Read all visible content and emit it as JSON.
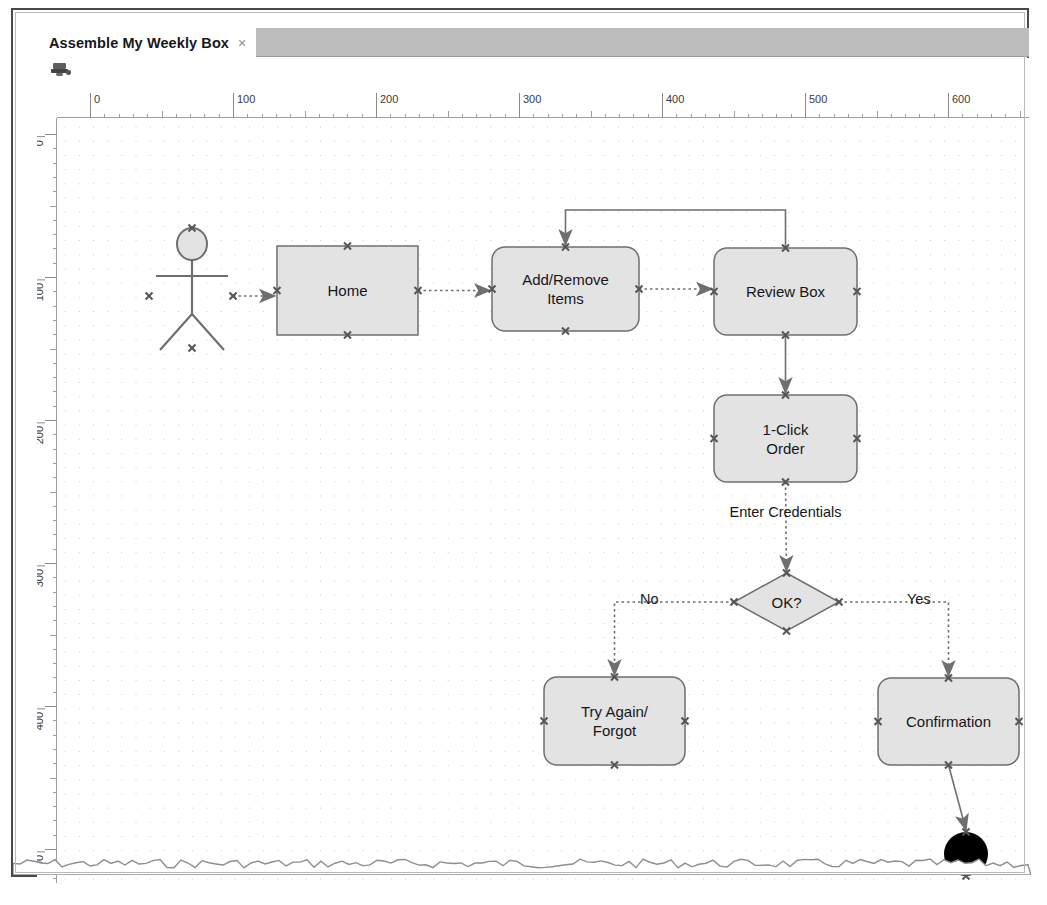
{
  "window": {
    "tab_title": "Assemble My Weekly Box",
    "tab_close_glyph": "×",
    "toolbar_icon": "stamp-icon"
  },
  "rulers": {
    "horizontal_labels": [
      "0",
      "100",
      "200",
      "300",
      "400",
      "500",
      "600"
    ],
    "vertical_labels": [
      "0",
      "100",
      "200",
      "300",
      "400",
      "500"
    ],
    "unit_step": 100,
    "minor_step": 10
  },
  "diagram": {
    "type": "activity-flowchart",
    "grid": "dotted",
    "nodes": [
      {
        "id": "actor",
        "kind": "actor",
        "label": "",
        "x": 104,
        "y": 110,
        "w": 62,
        "h": 120
      },
      {
        "id": "home",
        "kind": "rect",
        "label": "Home",
        "x": 220,
        "y": 128,
        "w": 141,
        "h": 89
      },
      {
        "id": "add_remove",
        "kind": "round-rect",
        "label": "Add/Remove\nItems",
        "x": 435,
        "y": 129,
        "w": 147,
        "h": 84
      },
      {
        "id": "review_box",
        "kind": "round-rect",
        "label": "Review Box",
        "x": 657,
        "y": 130,
        "w": 143,
        "h": 87
      },
      {
        "id": "one_click",
        "kind": "round-rect",
        "label": "1-Click\nOrder",
        "x": 657,
        "y": 277,
        "w": 143,
        "h": 87
      },
      {
        "id": "ok_decision",
        "kind": "diamond",
        "label": "OK?",
        "x": 677,
        "y": 455,
        "w": 105,
        "h": 58
      },
      {
        "id": "try_again",
        "kind": "round-rect",
        "label": "Try Again/\nForgot",
        "x": 487,
        "y": 559,
        "w": 141,
        "h": 88
      },
      {
        "id": "confirmation",
        "kind": "round-rect",
        "label": "Confirmation",
        "x": 821,
        "y": 560,
        "w": 141,
        "h": 87
      },
      {
        "id": "end",
        "kind": "end-node",
        "label": "",
        "x": 887,
        "y": 714,
        "w": 44,
        "h": 44
      }
    ],
    "edges": [
      {
        "from": "actor",
        "to": "home",
        "label": ""
      },
      {
        "from": "home",
        "to": "add_remove",
        "label": ""
      },
      {
        "from": "add_remove",
        "to": "review_box",
        "label": ""
      },
      {
        "from": "review_box",
        "to": "add_remove",
        "label": "",
        "routing": "loop-over-top"
      },
      {
        "from": "review_box",
        "to": "one_click",
        "label": ""
      },
      {
        "from": "one_click",
        "to": "ok_decision",
        "label": "Enter Credentials"
      },
      {
        "from": "ok_decision",
        "to": "try_again",
        "label": "No"
      },
      {
        "from": "ok_decision",
        "to": "confirmation",
        "label": "Yes"
      },
      {
        "from": "confirmation",
        "to": "end",
        "label": ""
      }
    ],
    "edge_labels": {
      "enter_credentials": "Enter Credentials",
      "no": "No",
      "yes": "Yes"
    }
  },
  "colors": {
    "node_fill": "#e3e3e3",
    "node_stroke": "#6f6f6f",
    "edge_stroke": "#6f6f6f",
    "grid_dot": "#c2c2c8",
    "canvas_bg": "#ffffff",
    "tabstrip_bg": "#bdbdbd",
    "text": "#16161a"
  }
}
